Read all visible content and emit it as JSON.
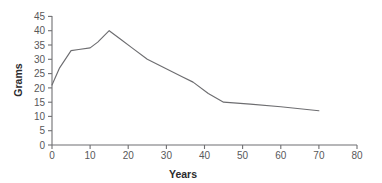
{
  "chart_data": {
    "type": "line",
    "title": "",
    "xlabel": "Years",
    "ylabel": "Grams",
    "xlim": [
      0,
      80
    ],
    "ylim": [
      0,
      45
    ],
    "xticks": [
      0,
      10,
      20,
      30,
      40,
      50,
      60,
      70,
      80
    ],
    "xtick_labels": [
      "0",
      "10",
      "20",
      "30",
      "40",
      "50",
      "60",
      "70",
      "80"
    ],
    "yticks": [
      0,
      5,
      10,
      15,
      20,
      25,
      30,
      35,
      40,
      45
    ],
    "ytick_labels": [
      "0",
      "5",
      "10",
      "15",
      "20",
      "25",
      "30",
      "35",
      "40",
      "45"
    ],
    "grid": false,
    "legend": false,
    "legend_position": "none",
    "line_color": "#6d6d70",
    "axis_color": "#6f6f72",
    "text_color": "#58585a",
    "series": [
      {
        "name": "Grams",
        "x": [
          0,
          2,
          5,
          7,
          10,
          12,
          15,
          18,
          21,
          25,
          28,
          31,
          34,
          37,
          41,
          45,
          52,
          60,
          70
        ],
        "y": [
          21,
          27,
          33,
          33.4,
          34,
          36,
          40,
          37,
          34,
          30,
          28,
          26,
          24,
          22,
          18,
          15,
          14.3,
          13.4,
          12
        ]
      }
    ],
    "annotations": []
  }
}
